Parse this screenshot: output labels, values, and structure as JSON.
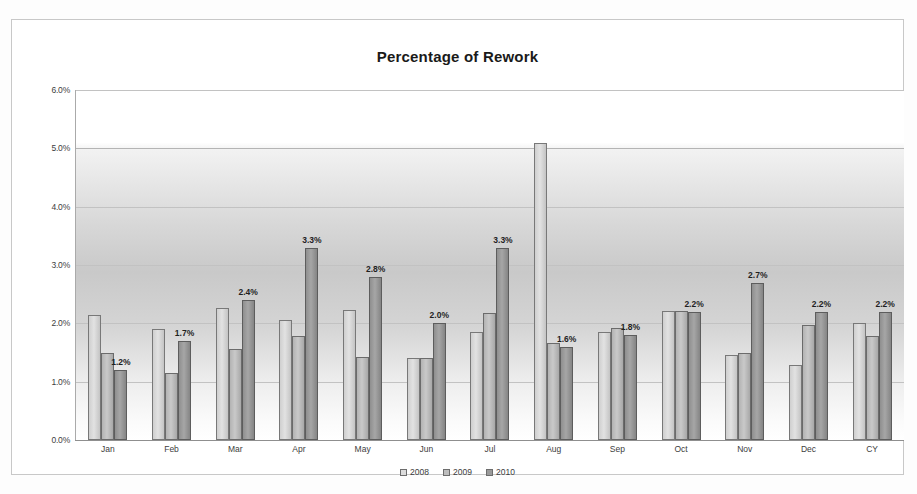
{
  "chart_data": {
    "type": "bar",
    "title": "Percentage of Rework",
    "xlabel": "",
    "ylabel": "",
    "ylim": [
      0,
      6
    ],
    "ytick_labels": [
      "6.0%",
      "5.0%",
      "4.0%",
      "3.0%",
      "2.0%",
      "1.0%",
      "0.0%"
    ],
    "ytick_values": [
      6.0,
      5.0,
      4.0,
      3.0,
      2.0,
      1.0,
      0.0
    ],
    "grid": true,
    "legend_position": "bottom",
    "categories": [
      "Jan",
      "Feb",
      "Mar",
      "Apr",
      "May",
      "Jun",
      "Jul",
      "Aug",
      "Sep",
      "Oct",
      "Nov",
      "Dec",
      "CY"
    ],
    "series": [
      {
        "name": "2008",
        "values": [
          2.15,
          1.9,
          2.27,
          2.05,
          2.23,
          1.4,
          1.85,
          5.1,
          1.85,
          2.22,
          1.45,
          1.28,
          2.0
        ]
      },
      {
        "name": "2009",
        "values": [
          1.5,
          1.15,
          1.56,
          1.78,
          1.43,
          1.4,
          2.17,
          1.66,
          1.92,
          2.22,
          1.5,
          1.98,
          1.78
        ]
      },
      {
        "name": "2010",
        "values": [
          1.2,
          1.7,
          2.4,
          3.3,
          2.8,
          2.0,
          3.3,
          1.6,
          1.8,
          2.2,
          2.7,
          2.2,
          2.2
        ]
      }
    ],
    "data_labels": {
      "series": "2010",
      "values": [
        "1.2%",
        "1.7%",
        "2.4%",
        "3.3%",
        "2.8%",
        "2.0%",
        "3.3%",
        "1.6%",
        "1.8%",
        "2.2%",
        "2.7%",
        "2.2%",
        "2.2%"
      ]
    },
    "colors": {
      "series_2008": "#dcdcdc",
      "series_2009": "#bdbdbd",
      "series_2010": "#9a9a9a",
      "gridline": "#c2c2c2",
      "title_text": "#1a1a1a",
      "tick_text": "#3d3d3d",
      "frame_border": "#c8c8c8"
    }
  }
}
